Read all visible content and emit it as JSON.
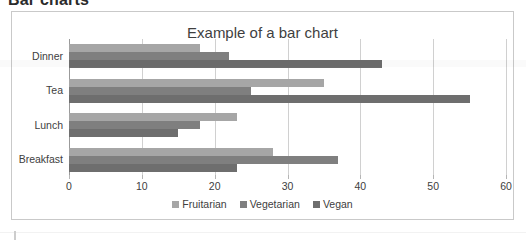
{
  "page": {
    "heading": "Bar charts"
  },
  "chart_frame": {
    "border_color": "#c9c9c9",
    "background": "#ffffff"
  },
  "legend": {
    "position": "bottom",
    "items": [
      {
        "label": "Fruitarian",
        "color": "#a6a6a6",
        "swatch": "legend-swatch-icon"
      },
      {
        "label": "Vegetarian",
        "color": "#7f7f7f",
        "swatch": "legend-swatch-icon"
      },
      {
        "label": "Vegan",
        "color": "#6e6e6e",
        "swatch": "legend-swatch-icon"
      }
    ]
  },
  "chart_data": {
    "type": "bar",
    "orientation": "horizontal",
    "title": "Example of a bar chart",
    "xlabel": "",
    "ylabel": "",
    "categories": [
      "Breakfast",
      "Lunch",
      "Tea",
      "Dinner"
    ],
    "category_order_top_to_bottom": [
      "Dinner",
      "Tea",
      "Lunch",
      "Breakfast"
    ],
    "series": [
      {
        "name": "Fruitarian",
        "color": "#a6a6a6",
        "values": [
          28,
          23,
          35,
          18
        ]
      },
      {
        "name": "Vegetarian",
        "color": "#7f7f7f",
        "values": [
          37,
          18,
          25,
          22
        ]
      },
      {
        "name": "Vegan",
        "color": "#6e6e6e",
        "values": [
          23,
          15,
          55,
          43
        ]
      }
    ],
    "xlim": [
      0,
      60
    ],
    "xticks": [
      0,
      10,
      20,
      30,
      40,
      50,
      60
    ],
    "xtick_labels": [
      "0",
      "10",
      "20",
      "30",
      "40",
      "50",
      "60"
    ],
    "grid": "vertical",
    "legend": "bottom"
  }
}
